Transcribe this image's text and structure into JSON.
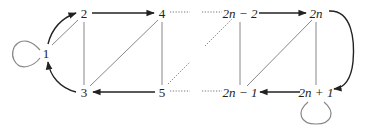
{
  "diagram": {
    "type": "graph",
    "nodes": [
      {
        "id": "1",
        "label": "1"
      },
      {
        "id": "2",
        "label": "2"
      },
      {
        "id": "3",
        "label": "3"
      },
      {
        "id": "4",
        "label": "4"
      },
      {
        "id": "5",
        "label": "5"
      },
      {
        "id": "2n-2",
        "label": "2n − 2"
      },
      {
        "id": "2n-1",
        "label": "2n − 1"
      },
      {
        "id": "2n",
        "label": "2n"
      },
      {
        "id": "2n+1",
        "label": "2n + 1"
      }
    ],
    "directed_edges": [
      {
        "from": "1",
        "to": "2"
      },
      {
        "from": "3",
        "to": "1"
      },
      {
        "from": "2",
        "to": "4"
      },
      {
        "from": "5",
        "to": "3"
      },
      {
        "from": "2n-2",
        "to": "2n"
      },
      {
        "from": "2n+1",
        "to": "2n-1"
      },
      {
        "from": "2n",
        "to": "2n+1"
      }
    ],
    "undirected_edges": [
      {
        "a": "1",
        "b": "2"
      },
      {
        "a": "2",
        "b": "3"
      },
      {
        "a": "3",
        "b": "4"
      },
      {
        "a": "4",
        "b": "5"
      },
      {
        "a": "2n-2",
        "b": "2n-1"
      },
      {
        "a": "2n-1",
        "b": "2n"
      },
      {
        "a": "2n",
        "b": "2n+1"
      }
    ],
    "loops": [
      "1",
      "2n+1"
    ],
    "ellipsis_edges": [
      {
        "from": "4",
        "to": "2n-2"
      },
      {
        "from": "5",
        "to": "2n-1"
      },
      {
        "from": "5",
        "to": "2n-2"
      }
    ]
  }
}
